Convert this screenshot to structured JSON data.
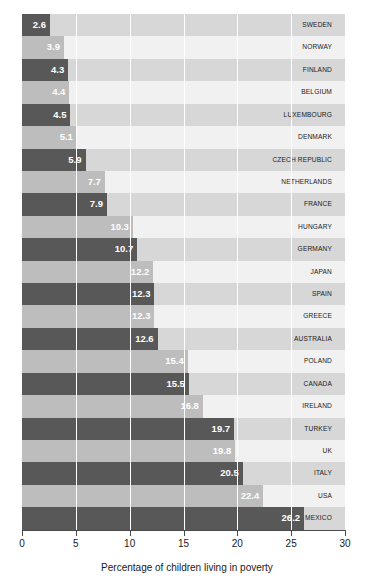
{
  "chart_data": {
    "type": "bar",
    "orientation": "horizontal",
    "title": "",
    "xlabel": "Percentage of children living in poverty",
    "ylabel": "",
    "xlim": [
      0,
      30
    ],
    "xticks": [
      "0",
      "5",
      "10",
      "15",
      "20",
      "25",
      "30"
    ],
    "xtick_values": [
      0,
      5,
      10,
      15,
      20,
      25,
      30
    ],
    "grid": true,
    "legend": null,
    "categories": [
      "SWEDEN",
      "NORWAY",
      "FINLAND",
      "BELGIUM",
      "LUXEMBOURG",
      "DENMARK",
      "CZECH REPUBLIC",
      "NETHERLANDS",
      "FRANCE",
      "HUNGARY",
      "GERMANY",
      "JAPAN",
      "SPAIN",
      "GREECE",
      "AUSTRALIA",
      "POLAND",
      "CANADA",
      "IRELAND",
      "TURKEY",
      "UK",
      "ITALY",
      "USA",
      "MEXICO"
    ],
    "values": [
      2.6,
      3.9,
      4.3,
      4.4,
      4.5,
      5.1,
      5.9,
      7.7,
      7.9,
      10.3,
      10.7,
      12.2,
      12.3,
      12.3,
      12.6,
      15.4,
      15.5,
      16.8,
      19.7,
      19.8,
      20.5,
      22.4,
      26.2
    ],
    "value_labels": [
      "2.6",
      "3.9",
      "4.3",
      "4.4",
      "4.5",
      "5.1",
      "5.9",
      "7.7",
      "7.9",
      "10.3",
      "10.7",
      "12.2",
      "12.3",
      "12.3",
      "12.6",
      "15.4",
      "15.5",
      "16.8",
      "19.7",
      "19.8",
      "20.5",
      "22.4",
      "26.2"
    ],
    "colors": {
      "bar_dark": "#585858",
      "bar_light": "#bdbdbd",
      "band_dark": "#d7d7d7",
      "band_light": "#f1f1f1",
      "label_text": "#ffffff",
      "axis": "#4a4a4a",
      "text": "#1a1a1a"
    }
  }
}
